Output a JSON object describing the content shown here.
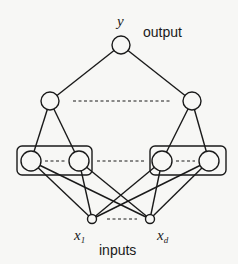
{
  "diagram": {
    "labels": {
      "output_var": "y",
      "output_text": "output",
      "input_first_var": "x",
      "input_first_sub": "1",
      "input_last_var": "x",
      "input_last_sub": "d",
      "inputs_text": "inputs"
    },
    "layers": [
      {
        "name": "inputs",
        "nodes": [
          "x1",
          "xd"
        ],
        "ellipsis": true
      },
      {
        "name": "hidden-1",
        "groups": [
          [
            "h1a",
            "h1b"
          ],
          [
            "h1c",
            "h1d"
          ]
        ],
        "ellipsis_within_groups": true,
        "ellipsis_between_groups": true
      },
      {
        "name": "hidden-2",
        "nodes": [
          "h2a",
          "h2b"
        ],
        "ellipsis": true
      },
      {
        "name": "output",
        "nodes": [
          "y"
        ]
      }
    ],
    "edges": [
      [
        "y",
        "h2a"
      ],
      [
        "y",
        "h2b"
      ],
      [
        "h2a",
        "h1a"
      ],
      [
        "h2a",
        "h1b"
      ],
      [
        "h2b",
        "h1c"
      ],
      [
        "h2b",
        "h1d"
      ],
      [
        "h1a",
        "x1"
      ],
      [
        "h1a",
        "xd"
      ],
      [
        "h1b",
        "x1"
      ],
      [
        "h1b",
        "xd"
      ],
      [
        "h1c",
        "x1"
      ],
      [
        "h1c",
        "xd"
      ],
      [
        "h1d",
        "x1"
      ],
      [
        "h1d",
        "xd"
      ]
    ]
  }
}
